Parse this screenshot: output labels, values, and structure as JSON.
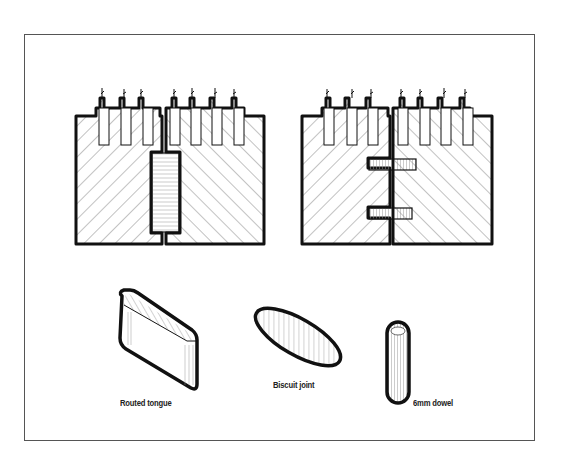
{
  "diagram": {
    "title": "",
    "panels": [
      {
        "id": "routed-tongue-joint",
        "joint_type": "Routed tongue",
        "connectors": 1
      },
      {
        "id": "dowel-joint",
        "joint_type": "6mm dowel",
        "connectors": 2
      }
    ],
    "labels": {
      "routed_tongue": "Routed tongue",
      "biscuit_joint": "Biscuit joint",
      "dowel": "6mm dowel"
    },
    "colors": {
      "ink": "#111111",
      "hatch": "#555555",
      "frame": "#555555",
      "background": "#ffffff"
    }
  }
}
